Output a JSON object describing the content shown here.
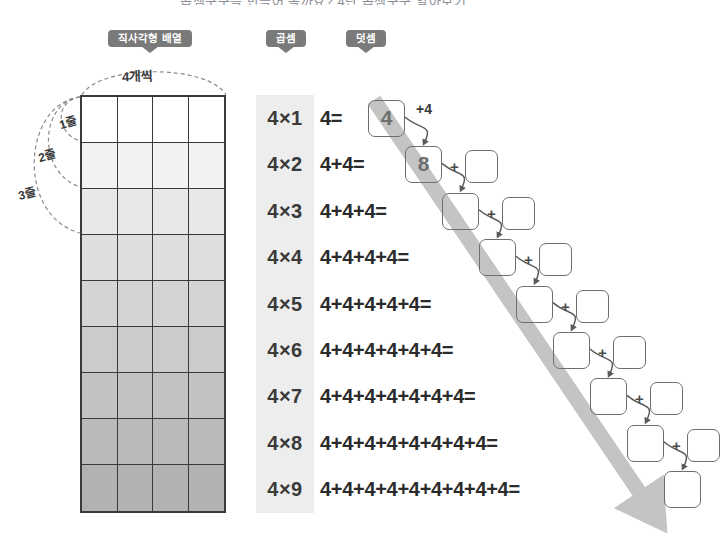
{
  "page": {
    "cut_title": "곱셈구구를 만들어 볼까요? 4단 곱셈구구 알아보기",
    "bg_color": "#ffffff"
  },
  "tags": [
    {
      "id": "array",
      "label": "직사각형 배열",
      "x": 108,
      "w": 84
    },
    {
      "id": "mult",
      "label": "곱셈식",
      "x": 266,
      "w": 40
    },
    {
      "id": "add",
      "label": "덧셈식",
      "x": 346,
      "w": 40
    }
  ],
  "grid": {
    "columns": 4,
    "rows": 9,
    "top_label": "4개씩",
    "row_labels": [
      "1줄",
      "2줄",
      "3줄"
    ],
    "row_shades": [
      "#ffffff",
      "#f2f2f2",
      "#e8e8e8",
      "#dedede",
      "#d4d4d4",
      "#cbcbcb",
      "#c2c2c2",
      "#bababa",
      "#b2b2b2"
    ],
    "border_color": "#3a3a3a"
  },
  "mult_column": {
    "bg_color": "#ededed",
    "rows": [
      "4×1",
      "4×2",
      "4×3",
      "4×4",
      "4×5",
      "4×6",
      "4×7",
      "4×8",
      "4×9"
    ]
  },
  "add_column": {
    "arrow_color": "#c4c4c4",
    "rows": [
      {
        "expr": "4=",
        "answer": "4",
        "step": "+4",
        "step_box": false,
        "expr_x": 0,
        "box_x": 48,
        "plus_x": 96,
        "pbox_x": 0
      },
      {
        "expr": "4+4=",
        "answer": "8",
        "step": "+",
        "step_box": true,
        "expr_x": 0,
        "box_x": 85,
        "plus_x": 130,
        "pbox_x": 145
      },
      {
        "expr": "4+4+4=",
        "answer": "",
        "step": "+",
        "step_box": true,
        "expr_x": 0,
        "box_x": 122,
        "plus_x": 167,
        "pbox_x": 182
      },
      {
        "expr": "4+4+4+4=",
        "answer": "",
        "step": "+",
        "step_box": true,
        "expr_x": 0,
        "box_x": 159,
        "plus_x": 204,
        "pbox_x": 219
      },
      {
        "expr": "4+4+4+4+4=",
        "answer": "",
        "step": "+",
        "step_box": true,
        "expr_x": 0,
        "box_x": 196,
        "plus_x": 241,
        "pbox_x": 256
      },
      {
        "expr": "4+4+4+4+4+4=",
        "answer": "",
        "step": "+",
        "step_box": true,
        "expr_x": 0,
        "box_x": 233,
        "plus_x": 278,
        "pbox_x": 293
      },
      {
        "expr": "4+4+4+4+4+4+4=",
        "answer": "",
        "step": "+",
        "step_box": true,
        "expr_x": 0,
        "box_x": 270,
        "plus_x": 315,
        "pbox_x": 330
      },
      {
        "expr": "4+4+4+4+4+4+4+4=",
        "answer": "",
        "step": "+",
        "step_box": true,
        "expr_x": 0,
        "box_x": 307,
        "plus_x": 352,
        "pbox_x": 367
      },
      {
        "expr": "4+4+4+4+4+4+4+4+4=",
        "answer": "",
        "step": "",
        "step_box": false,
        "expr_x": 0,
        "box_x": 344,
        "plus_x": 0,
        "pbox_x": 0
      }
    ]
  }
}
